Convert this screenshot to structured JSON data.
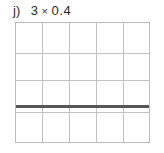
{
  "problem": {
    "item_letter": "j)",
    "expression": "3 × 0.4",
    "operand_left": "3",
    "operator_symbol": "×",
    "operand_right": "0.4"
  },
  "figure": {
    "type": "grid-model",
    "columns": 5,
    "rows": 4,
    "grid_line_color": "#c2c2c2",
    "border_color": "#bdbdbd",
    "background_color": "#ffffff",
    "marks": [
      {
        "kind": "horizontal-rule",
        "color": "#555759",
        "after_row": 3,
        "thickness_px": 3
      }
    ]
  },
  "colors": {
    "text": "#2b2b2b",
    "rule": "#555759",
    "gridline": "#c2c2c2",
    "page": "#ffffff"
  }
}
